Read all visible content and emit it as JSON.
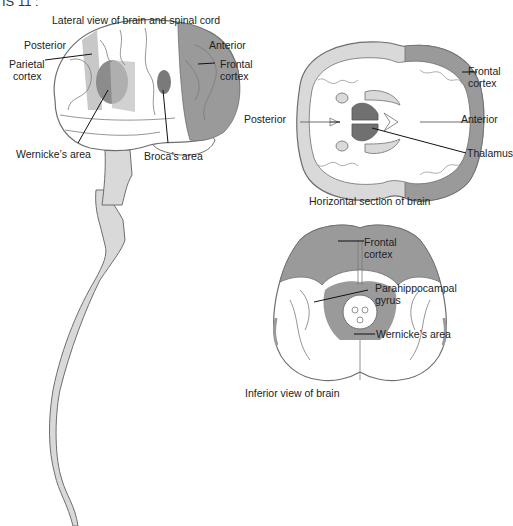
{
  "header_fragment": "IS 11 :",
  "panels": {
    "lateral": {
      "caption": "Lateral view of brain and spinal cord",
      "labels": {
        "posterior": "Posterior",
        "anterior": "Anterior",
        "parietal": [
          "Parietal",
          "cortex"
        ],
        "frontal": [
          "Frontal",
          "cortex"
        ],
        "wernicke": "Wernicke’s area",
        "broca": "Broca’s area"
      }
    },
    "horizontal": {
      "caption": "Horizontal section of brain",
      "labels": {
        "posterior": "Posterior",
        "anterior": "Anterior",
        "frontal": [
          "Frontal",
          "cortex"
        ],
        "thalamus": "Thalamus"
      }
    },
    "inferior": {
      "caption": "Inferior view of brain",
      "labels": {
        "frontal": [
          "Frontal",
          "cortex"
        ],
        "parahippocampal": [
          "Parahippocampal",
          "gyrus"
        ],
        "wernicke": "Wernicke’s area"
      }
    }
  },
  "colors": {
    "outline": "#6e6e6e",
    "white_matter": "#ffffff",
    "cortex_light": "#d9d9d9",
    "highlight": "#9a9a9a",
    "dark_region": "#707070",
    "leader": "#111111"
  }
}
